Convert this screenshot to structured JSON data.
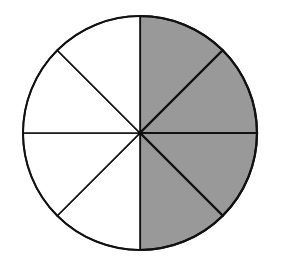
{
  "diagram": {
    "type": "fraction-circle",
    "total_sectors": 8,
    "shaded_sectors": 4,
    "shaded_positions": "right half",
    "colors": {
      "shade": "#999999",
      "unshaded": "#ffffff",
      "stroke": "#111111"
    }
  }
}
